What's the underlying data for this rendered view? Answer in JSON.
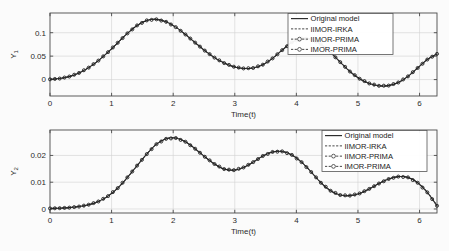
{
  "figure": {
    "background": "#fbfbfb",
    "accent": "#1c1c1c"
  },
  "chart_data": [
    {
      "type": "line",
      "id": "top",
      "title": "",
      "xlabel": "Time(t)",
      "ylabel": "Y_1",
      "ylabel_display": "Y",
      "ylabel_sub": "1",
      "xlim": [
        0,
        6.2832
      ],
      "ylim": [
        -0.035,
        0.142
      ],
      "xticks": [
        0,
        1,
        2,
        3,
        4,
        5,
        6
      ],
      "xticklabels": [
        "0",
        "1",
        "2",
        "3",
        "4",
        "5",
        "6"
      ],
      "yticks": [
        0,
        0.05,
        0.1
      ],
      "yticklabels": [
        "0",
        "0.05",
        "0.1"
      ],
      "grid": true,
      "legend_position": "upper right",
      "legend": [
        "Original model",
        "IIMOR-IRKA",
        "IIMOR-PRIMA",
        "IMOR-PRIMA"
      ],
      "x": [
        0,
        0.1571,
        0.3142,
        0.4712,
        0.6283,
        0.7854,
        0.9425,
        1.0996,
        1.2566,
        1.4137,
        1.5708,
        1.7279,
        1.885,
        2.042,
        2.1991,
        2.3562,
        2.5133,
        2.6704,
        2.8274,
        2.9845,
        3.1416,
        3.2987,
        3.4558,
        3.6128,
        3.7699,
        3.927,
        4.0841,
        4.2412,
        4.3982,
        4.5553,
        4.7124,
        4.8695,
        5.0265,
        5.1836,
        5.3407,
        5.4978,
        5.6549,
        5.8119,
        5.969,
        6.1261,
        6.2832
      ],
      "series": [
        {
          "name": "Original model",
          "style": "solid",
          "values": [
            0.0005,
            0.0022,
            0.0065,
            0.0142,
            0.0255,
            0.0405,
            0.0585,
            0.0785,
            0.0985,
            0.1155,
            0.1262,
            0.1285,
            0.1232,
            0.1118,
            0.0962,
            0.0788,
            0.0618,
            0.0468,
            0.0352,
            0.0275,
            0.0238,
            0.0248,
            0.0318,
            0.0452,
            0.0628,
            0.0795,
            0.0878,
            0.0862,
            0.0752,
            0.0578,
            0.0372,
            0.0172,
            0.0018,
            -0.0082,
            -0.0132,
            -0.0128,
            -0.0062,
            0.0068,
            0.0248,
            0.0428,
            0.0548
          ]
        },
        {
          "name": "IIMOR-IRKA",
          "style": "dashed",
          "values": [
            0.0005,
            0.0022,
            0.0065,
            0.0142,
            0.0255,
            0.0405,
            0.0585,
            0.0785,
            0.0985,
            0.1155,
            0.1262,
            0.1285,
            0.1232,
            0.1118,
            0.0962,
            0.0788,
            0.0618,
            0.0468,
            0.0352,
            0.0275,
            0.0238,
            0.0248,
            0.0318,
            0.0452,
            0.0628,
            0.0795,
            0.0878,
            0.0862,
            0.0752,
            0.0578,
            0.0372,
            0.0172,
            0.0018,
            -0.0082,
            -0.0132,
            -0.0128,
            -0.0062,
            0.0068,
            0.0248,
            0.0428,
            0.0548
          ]
        },
        {
          "name": "IIMOR-PRIMA",
          "style": "dashed-circle",
          "values": [
            0.0005,
            0.0022,
            0.0065,
            0.0142,
            0.0255,
            0.0405,
            0.0585,
            0.0785,
            0.0985,
            0.1155,
            0.1262,
            0.1285,
            0.1232,
            0.1118,
            0.0962,
            0.0788,
            0.0618,
            0.0468,
            0.0352,
            0.0275,
            0.0238,
            0.0248,
            0.0318,
            0.0452,
            0.0628,
            0.0795,
            0.0878,
            0.0862,
            0.0752,
            0.0578,
            0.0372,
            0.0172,
            0.0018,
            -0.0082,
            -0.0132,
            -0.0128,
            -0.0062,
            0.0068,
            0.0248,
            0.0428,
            0.0548
          ]
        },
        {
          "name": "IMOR-PRIMA",
          "style": "dashed-circle",
          "values": [
            0.0005,
            0.0022,
            0.0065,
            0.0142,
            0.0255,
            0.0405,
            0.0585,
            0.0785,
            0.0985,
            0.1155,
            0.1262,
            0.1285,
            0.1232,
            0.1118,
            0.0962,
            0.0788,
            0.0618,
            0.0468,
            0.0352,
            0.0275,
            0.0238,
            0.0248,
            0.0318,
            0.0452,
            0.0628,
            0.0795,
            0.0878,
            0.0862,
            0.0752,
            0.0578,
            0.0372,
            0.0172,
            0.0018,
            -0.0082,
            -0.0132,
            -0.0128,
            -0.0062,
            0.0068,
            0.0248,
            0.0428,
            0.0548
          ]
        }
      ],
      "annotations": {
        "peak1": {
          "x": 1.35,
          "y": 0.1285
        },
        "trough1": {
          "x": 2.4,
          "y": 0.0205
        },
        "peak2": {
          "x": 3.3,
          "y": 0.0895
        },
        "trough2": {
          "x": 4.4,
          "y": -0.0145
        },
        "peak3": {
          "x": 5.35,
          "y": 0.0565
        },
        "end": {
          "x": 6.2832,
          "y": -0.0295
        }
      }
    },
    {
      "type": "line",
      "id": "bottom",
      "title": "",
      "xlabel": "Time(t)",
      "ylabel": "Y_2",
      "ylabel_display": "Y",
      "ylabel_sub": "2",
      "xlim": [
        0,
        6.2832
      ],
      "ylim": [
        -0.0015,
        0.0295
      ],
      "xticks": [
        0,
        1,
        2,
        3,
        4,
        5,
        6
      ],
      "xticklabels": [
        "0",
        "1",
        "2",
        "3",
        "4",
        "5",
        "6"
      ],
      "yticks": [
        0,
        0.01,
        0.02
      ],
      "yticklabels": [
        "0",
        "0.01",
        "0.02"
      ],
      "grid": true,
      "legend_position": "upper right",
      "legend": [
        "Original model",
        "IIMOR-IRKA",
        "IIMOR-PRIMA",
        "IMOR-PRIMA"
      ],
      "x": [
        0,
        0.1571,
        0.3142,
        0.4712,
        0.6283,
        0.7854,
        0.9425,
        1.0996,
        1.2566,
        1.4137,
        1.5708,
        1.7279,
        1.885,
        2.042,
        2.1991,
        2.3562,
        2.5133,
        2.6704,
        2.8274,
        2.9845,
        3.1416,
        3.2987,
        3.4558,
        3.6128,
        3.7699,
        3.927,
        4.0841,
        4.2412,
        4.3982,
        4.5553,
        4.7124,
        4.8695,
        5.0265,
        5.1836,
        5.3407,
        5.4978,
        5.6549,
        5.8119,
        5.969,
        6.1261,
        6.2832
      ],
      "series": [
        {
          "name": "Original model",
          "style": "solid",
          "values": [
            0.0002,
            0.0003,
            0.0005,
            0.0009,
            0.0016,
            0.0028,
            0.0048,
            0.0078,
            0.0118,
            0.0162,
            0.0205,
            0.0242,
            0.0262,
            0.0265,
            0.0251,
            0.0225,
            0.0195,
            0.0168,
            0.0149,
            0.0145,
            0.0155,
            0.0175,
            0.0198,
            0.0213,
            0.0215,
            0.0202,
            0.0175,
            0.0138,
            0.0098,
            0.0068,
            0.0052,
            0.005,
            0.0058,
            0.0075,
            0.0095,
            0.0112,
            0.0121,
            0.0118,
            0.0098,
            0.0062,
            0.0012
          ]
        },
        {
          "name": "IIMOR-IRKA",
          "style": "dashed",
          "values": [
            0.0002,
            0.0003,
            0.0005,
            0.0009,
            0.0016,
            0.0028,
            0.0048,
            0.0078,
            0.0118,
            0.0162,
            0.0205,
            0.0242,
            0.0262,
            0.0265,
            0.0251,
            0.0225,
            0.0195,
            0.0168,
            0.0149,
            0.0145,
            0.0155,
            0.0175,
            0.0198,
            0.0213,
            0.0215,
            0.0202,
            0.0175,
            0.0138,
            0.0098,
            0.0068,
            0.0052,
            0.005,
            0.0058,
            0.0075,
            0.0095,
            0.0112,
            0.0121,
            0.0118,
            0.0098,
            0.0062,
            0.0012
          ]
        },
        {
          "name": "IIMOR-PRIMA",
          "style": "dashed-circle",
          "values": [
            0.0002,
            0.0003,
            0.0005,
            0.0009,
            0.0016,
            0.0028,
            0.0048,
            0.0078,
            0.0118,
            0.0162,
            0.0205,
            0.0242,
            0.0262,
            0.0265,
            0.0251,
            0.0225,
            0.0195,
            0.0168,
            0.0149,
            0.0145,
            0.0155,
            0.0175,
            0.0198,
            0.0213,
            0.0215,
            0.0202,
            0.0175,
            0.0138,
            0.0098,
            0.0068,
            0.0052,
            0.005,
            0.0058,
            0.0075,
            0.0095,
            0.0112,
            0.0121,
            0.0118,
            0.0098,
            0.0062,
            0.0012
          ]
        },
        {
          "name": "IMOR-PRIMA",
          "style": "dashed-circle",
          "values": [
            0.0002,
            0.0003,
            0.0005,
            0.0009,
            0.0016,
            0.0028,
            0.0048,
            0.0078,
            0.0118,
            0.0162,
            0.0205,
            0.0242,
            0.0262,
            0.0265,
            0.0251,
            0.0225,
            0.0195,
            0.0168,
            0.0149,
            0.0145,
            0.0155,
            0.0175,
            0.0198,
            0.0213,
            0.0215,
            0.0202,
            0.0175,
            0.0138,
            0.0098,
            0.0068,
            0.0052,
            0.005,
            0.0058,
            0.0075,
            0.0095,
            0.0112,
            0.0121,
            0.0118,
            0.0098,
            0.0062,
            0.0012
          ]
        }
      ],
      "annotations": {
        "peak1": {
          "x": 1.78,
          "y": 0.0265
        },
        "trough1": {
          "x": 2.85,
          "y": 0.0145
        },
        "peak2": {
          "x": 3.65,
          "y": 0.0215
        },
        "trough2": {
          "x": 4.85,
          "y": 0.005
        },
        "peak3": {
          "x": 5.65,
          "y": 0.0121
        },
        "end": {
          "x": 6.2832,
          "y": 0.0012
        }
      }
    }
  ]
}
